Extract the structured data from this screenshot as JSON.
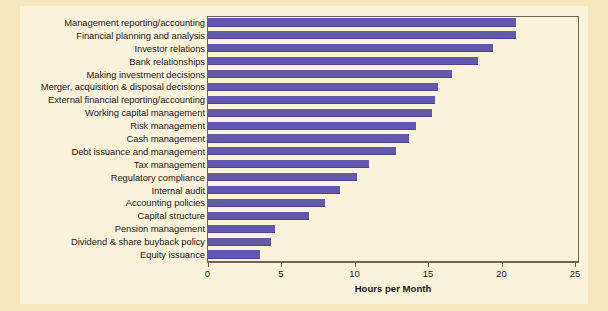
{
  "figure": {
    "background_color": "#f6e7bd",
    "panel_color": "#faf2da",
    "bar_color": "#6258ae",
    "axis_color": "#6b6552"
  },
  "chart_data": {
    "type": "bar",
    "orientation": "horizontal",
    "title": "",
    "xlabel": "Hours per Month",
    "ylabel": "",
    "xlim": [
      0,
      25
    ],
    "xticks": [
      0,
      5,
      10,
      15,
      20,
      25
    ],
    "xtick_labels": [
      "0",
      "5",
      "10",
      "15",
      "20",
      "25"
    ],
    "grid": false,
    "legend": null,
    "categories": [
      "Management reporting/accounting",
      "Financial planning and analysis",
      "Investor relations",
      "Bank relationships",
      "Making investment decisions",
      "Merger, acquisition & disposal decisions",
      "External financial reporting/accounting",
      "Working capital management",
      "Risk management",
      "Cash management",
      "Debt issuance and management",
      "Tax management",
      "Regulatory compliance",
      "Internal audit",
      "Accounting policies",
      "Capital structure",
      "Pension management",
      "Dividend & share buyback policy",
      "Equity issuance"
    ],
    "values": [
      21.0,
      21.0,
      19.4,
      18.4,
      16.6,
      15.7,
      15.5,
      15.3,
      14.2,
      13.7,
      12.8,
      11.0,
      10.2,
      9.0,
      8.0,
      6.9,
      4.6,
      4.3,
      3.6
    ]
  }
}
